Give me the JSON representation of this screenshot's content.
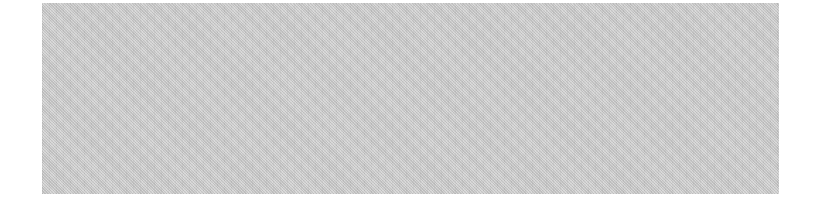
{
  "placeholder": {
    "fill_color": "#d2d2d2",
    "texture": "dithered halftone gray",
    "text": ""
  }
}
